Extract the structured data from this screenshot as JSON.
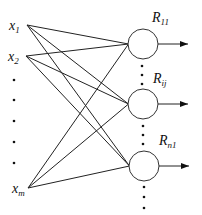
{
  "diagram": {
    "type": "neural-network",
    "inputs": [
      {
        "id": "x1",
        "base": "x",
        "sub": "1"
      },
      {
        "id": "x2",
        "base": "x",
        "sub": "2"
      },
      {
        "id": "xm",
        "base": "x",
        "sub": "m"
      }
    ],
    "outputs": [
      {
        "id": "R11",
        "base": "R",
        "sub": "11"
      },
      {
        "id": "Rij",
        "base": "R",
        "sub": "ij"
      },
      {
        "id": "Rn1",
        "base": "R",
        "sub": "n1"
      }
    ],
    "ellipsis": "⋮",
    "edge_color": "#222222",
    "node_stroke": "#333333"
  }
}
